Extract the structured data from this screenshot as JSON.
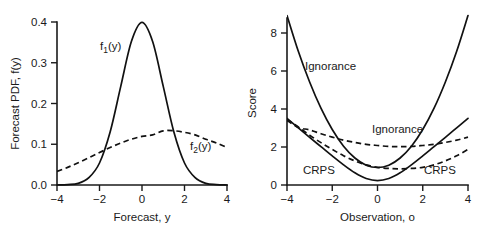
{
  "figure": {
    "background": "#ffffff",
    "ink_color": "#111111",
    "panels": [
      "left",
      "right"
    ]
  },
  "chart_data": [
    {
      "type": "line",
      "panel": "left",
      "title": "",
      "xlabel": "Forecast, y",
      "ylabel": "Forecast PDF, f(y)",
      "xlim": [
        -4,
        4
      ],
      "ylim": [
        0.0,
        0.4
      ],
      "xticks": [
        -4,
        -2,
        0,
        2,
        4
      ],
      "xticklabels": [
        "−4",
        "−2",
        "0",
        "2",
        "4"
      ],
      "yticks": [
        0.0,
        0.1,
        0.2,
        0.3,
        0.4
      ],
      "yticklabels": [
        "0.0",
        "0.1",
        "0.2",
        "0.3",
        "0.4"
      ],
      "grid": false,
      "legend": "inline-annotations",
      "annotations": [
        {
          "text": "f1(y)",
          "display": "f",
          "sub": "1",
          "tail": "(y)",
          "x": -1.35,
          "y": 0.315,
          "style": "solid"
        },
        {
          "text": "f2(y)",
          "display": "f",
          "sub": "2",
          "tail": "(y)",
          "x": 2.55,
          "y": 0.098,
          "style": "dashed"
        }
      ],
      "series": [
        {
          "name": "f1(y)",
          "style": "solid",
          "description": "Normal PDF, mean 0, standard deviation 1",
          "mean": 0,
          "sd": 1,
          "peak_value": 0.4,
          "peak_x": 0,
          "x": [
            -4.0,
            -3.5,
            -3.0,
            -2.5,
            -2.0,
            -1.5,
            -1.0,
            -0.5,
            0.0,
            0.5,
            1.0,
            1.5,
            2.0,
            2.5,
            3.0,
            3.5,
            4.0
          ],
          "values": [
            0.0,
            0.001,
            0.004,
            0.018,
            0.054,
            0.13,
            0.242,
            0.352,
            0.399,
            0.352,
            0.242,
            0.13,
            0.054,
            0.018,
            0.004,
            0.001,
            0.0
          ]
        },
        {
          "name": "f2(y)",
          "style": "dashed",
          "description": "Normal PDF, mean 1, standard deviation 3",
          "mean": 1,
          "sd": 3,
          "peak_value": 0.133,
          "peak_x": 1,
          "x": [
            -4.0,
            -3.5,
            -3.0,
            -2.5,
            -2.0,
            -1.5,
            -1.0,
            -0.5,
            0.0,
            0.5,
            1.0,
            1.5,
            2.0,
            2.5,
            3.0,
            3.5,
            4.0
          ],
          "values": [
            0.0331,
            0.0432,
            0.0547,
            0.0669,
            0.0796,
            0.0919,
            0.1031,
            0.1124,
            0.1193,
            0.123,
            0.133,
            0.133,
            0.1293,
            0.123,
            0.1124,
            0.1031,
            0.0919
          ]
        }
      ]
    },
    {
      "type": "line",
      "panel": "right",
      "title": "",
      "xlabel": "Observation, o",
      "ylabel": "Score",
      "xlim": [
        -4,
        4
      ],
      "ylim": [
        0,
        9.2
      ],
      "xticks": [
        -4,
        -2,
        0,
        2,
        4
      ],
      "xticklabels": [
        "−4",
        "−2",
        "0",
        "2",
        "4"
      ],
      "yticks": [
        0,
        2,
        4,
        6,
        8
      ],
      "yticklabels": [
        "0",
        "2",
        "4",
        "6",
        "8"
      ],
      "grid": false,
      "legend": "inline-annotations",
      "annotations": [
        {
          "text": "Ignorance",
          "x": -2.45,
          "y": 6.1,
          "style": "solid"
        },
        {
          "text": "Ignorance",
          "x": 0.25,
          "y": 2.85,
          "style": "dashed"
        },
        {
          "text": "CRPS",
          "x": -2.25,
          "y": 0.72,
          "style": "solid"
        },
        {
          "text": "CRPS",
          "x": 2.35,
          "y": 0.72,
          "style": "dashed"
        }
      ],
      "series": [
        {
          "name": "Ignorance (f1)",
          "style": "solid",
          "description": "Ignorance score for N(0,1) forecast",
          "x": [
            -4.0,
            -3.5,
            -3.0,
            -2.5,
            -2.0,
            -1.5,
            -1.0,
            -0.5,
            0.0,
            0.5,
            1.0,
            1.5,
            2.0,
            2.5,
            3.0,
            3.5,
            4.0
          ],
          "values": [
            8.92,
            7.04,
            5.42,
            4.04,
            2.92,
            2.04,
            1.42,
            1.04,
            0.92,
            1.04,
            1.42,
            2.04,
            2.92,
            4.04,
            5.42,
            7.04,
            8.92
          ]
        },
        {
          "name": "CRPS (f1)",
          "style": "solid",
          "description": "Continuous ranked probability score for N(0,1) forecast",
          "x": [
            -4.0,
            -3.5,
            -3.0,
            -2.5,
            -2.0,
            -1.5,
            -1.0,
            -0.5,
            0.0,
            0.5,
            1.0,
            1.5,
            2.0,
            2.5,
            3.0,
            3.5,
            4.0
          ],
          "values": [
            3.51,
            3.01,
            2.51,
            2.02,
            1.53,
            1.06,
            0.64,
            0.34,
            0.23,
            0.34,
            0.64,
            1.06,
            1.53,
            2.02,
            2.51,
            3.01,
            3.51
          ]
        },
        {
          "name": "Ignorance (f2)",
          "style": "dashed",
          "description": "Ignorance score for N(1,3) forecast",
          "x": [
            -4.0,
            -3.5,
            -3.0,
            -2.5,
            -2.0,
            -1.5,
            -1.0,
            -0.5,
            0.0,
            0.5,
            1.0,
            1.5,
            2.0,
            2.5,
            3.0,
            3.5,
            4.0
          ],
          "values": [
            3.4,
            3.03,
            2.9,
            2.7,
            2.52,
            2.36,
            2.24,
            2.14,
            2.08,
            2.03,
            2.02,
            2.03,
            2.08,
            2.14,
            2.24,
            2.36,
            2.52
          ]
        },
        {
          "name": "CRPS (f2)",
          "style": "dashed",
          "description": "Continuous ranked probability score for N(1,3) forecast",
          "x": [
            -4.0,
            -3.5,
            -3.0,
            -2.5,
            -2.0,
            -1.5,
            -1.0,
            -0.5,
            0.0,
            0.5,
            1.0,
            1.5,
            2.0,
            2.5,
            3.0,
            3.5,
            4.0
          ],
          "values": [
            3.45,
            3.05,
            2.62,
            2.23,
            1.87,
            1.54,
            1.27,
            1.06,
            0.93,
            0.87,
            0.85,
            0.87,
            0.93,
            1.06,
            1.27,
            1.54,
            1.87
          ]
        }
      ]
    }
  ]
}
